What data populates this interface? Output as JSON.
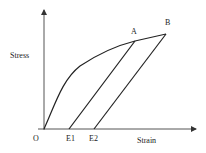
{
  "diagram": {
    "type": "stress-strain loading/unloading diagram",
    "y_axis_label": "Stress",
    "x_axis_label": "Strain",
    "origin_label": "O",
    "points": {
      "A": "A",
      "B": "B",
      "E1": "E1",
      "E2": "E2"
    },
    "curves": [
      {
        "name": "loading curve",
        "from": "O",
        "to": "B",
        "via": "A"
      },
      {
        "name": "unloading line from A",
        "from": "A",
        "to": "E1"
      },
      {
        "name": "unloading line from B",
        "from": "B",
        "to": "E2"
      }
    ],
    "colors": {
      "line": "#222222",
      "axis": "#333333",
      "background": "#ffffff"
    }
  }
}
